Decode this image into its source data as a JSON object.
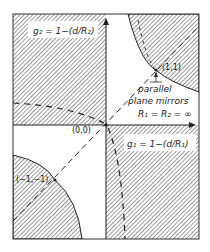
{
  "diagram": {
    "type": "stability-diagram",
    "axes": {
      "x_label": "g₁ = 1−(d/R₁)",
      "y_label": "g₂ = 1−(d/R₂)"
    },
    "points": [
      {
        "id": "origin",
        "label": "(0,0)"
      },
      {
        "id": "pos-one",
        "label": "(1,1)"
      },
      {
        "id": "neg-one",
        "label": "(−1,−1)"
      }
    ],
    "annotation": {
      "line1": "parallel",
      "line2": "plane mirrors",
      "line3": "R₁ = R₂ = ∞"
    },
    "colors": {
      "ink": "#222222",
      "hatch": "#555555",
      "background": "#ffffff"
    }
  }
}
